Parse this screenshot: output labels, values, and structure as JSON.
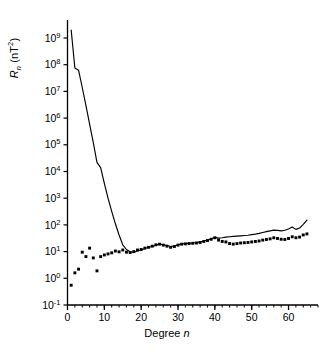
{
  "chart_data": {
    "type": "line",
    "title": "",
    "xlabel": "Degree n",
    "ylabel": "R_n (nT^2)",
    "xlabel_parts": {
      "text": "Degree ",
      "italic": "n"
    },
    "ylabel_parts": {
      "symbol": "R",
      "subscript": "n",
      "units_open": " (nT",
      "units_exp": "2",
      "units_close": ")"
    },
    "xlim": [
      0,
      68
    ],
    "ylim": [
      0.1,
      5000000000
    ],
    "yscale": "log",
    "xscale": "linear",
    "grid": false,
    "legend": null,
    "xticks": [
      0,
      10,
      20,
      30,
      40,
      50,
      60
    ],
    "xtick_labels": [
      "0",
      "10",
      "20",
      "30",
      "40",
      "50",
      "60"
    ],
    "xminor_step": 2,
    "yticks": [
      0.1,
      1,
      10,
      100,
      1000,
      10000,
      100000,
      1000000,
      10000000,
      100000000,
      1000000000
    ],
    "ytick_labels": [
      "10-1",
      "100",
      "101",
      "102",
      "103",
      "104",
      "105",
      "106",
      "107",
      "108",
      "109"
    ],
    "ytick_exponents": [
      "-1",
      "0",
      "1",
      "2",
      "3",
      "4",
      "5",
      "6",
      "7",
      "8",
      "9"
    ],
    "ytick_mantissa": "10",
    "series": [
      {
        "name": "model-spectrum-line",
        "style": "line",
        "color": "#000000",
        "x": [
          1,
          2,
          3,
          4,
          5,
          6,
          7,
          8,
          9,
          10,
          11,
          12,
          13,
          14,
          15,
          16,
          17,
          18,
          19,
          20,
          21,
          22,
          23,
          24,
          25,
          26,
          27,
          28,
          29,
          30,
          31,
          32,
          33,
          34,
          35,
          36,
          37,
          38,
          39,
          40,
          41,
          42,
          43,
          44,
          45,
          46,
          47,
          48,
          49,
          50,
          51,
          52,
          53,
          54,
          55,
          56,
          57,
          58,
          59,
          60,
          61,
          62,
          63,
          64,
          65
        ],
        "y": [
          2000000000.0,
          75000000.0,
          62000000.0,
          14000000.0,
          3000000.0,
          600000.0,
          120000.0,
          22000.0,
          14000.0,
          3600.0,
          1000.0,
          320.0,
          110.0,
          42.0,
          18.0,
          12.0,
          9.8,
          9.4,
          10.5,
          11.5,
          13.0,
          14.5,
          15.5,
          17.5,
          19.0,
          18.0,
          17.0,
          15.5,
          16.0,
          18.0,
          19.5,
          20.0,
          20.5,
          21.0,
          22.0,
          23.0,
          25.0,
          27.0,
          30.0,
          34.0,
          32.0,
          33.0,
          35.0,
          36.0,
          37.0,
          38.0,
          39.0,
          40.0,
          41.0,
          43.0,
          45.0,
          48.0,
          52.0,
          56.0,
          60.0,
          64.0,
          62.0,
          60.0,
          63.0,
          70.0,
          84.0,
          68.0,
          76.0,
          105.0,
          150.0
        ]
      },
      {
        "name": "error-estimate-dots",
        "style": "scatter",
        "color": "#000000",
        "marker": "square",
        "x": [
          1,
          2,
          3,
          4,
          5,
          6,
          7,
          8,
          9,
          10,
          11,
          12,
          13,
          14,
          15,
          16,
          17,
          18,
          19,
          20,
          21,
          22,
          23,
          24,
          25,
          26,
          27,
          28,
          29,
          30,
          31,
          32,
          33,
          34,
          35,
          36,
          37,
          38,
          39,
          40,
          41,
          42,
          43,
          44,
          45,
          46,
          47,
          48,
          49,
          50,
          51,
          52,
          53,
          54,
          55,
          56,
          57,
          58,
          59,
          60,
          61,
          62,
          63,
          64,
          65
        ],
        "y": [
          0.55,
          1.6,
          2.2,
          9.5,
          6.5,
          13.5,
          5.8,
          1.9,
          6.5,
          7.5,
          8.2,
          9.0,
          10.5,
          9.8,
          11.5,
          9.5,
          9.2,
          10.0,
          11.5,
          12.0,
          13.5,
          14.5,
          16.0,
          18.0,
          19.0,
          17.5,
          16.0,
          14.5,
          15.5,
          17.5,
          19.0,
          19.5,
          20.0,
          20.5,
          21.0,
          22.0,
          24.0,
          26.0,
          29.0,
          33.0,
          27.0,
          24.0,
          23.0,
          20.0,
          19.0,
          20.0,
          21.0,
          21.5,
          22.0,
          23.0,
          24.0,
          25.0,
          27.0,
          28.5,
          30.0,
          33.0,
          31.0,
          29.0,
          28.5,
          31.0,
          36.0,
          33.0,
          35.0,
          42.0,
          46.0
        ]
      }
    ]
  },
  "axes": {
    "frame_color": "#000000",
    "tick_color": "#000000",
    "background": "#ffffff"
  }
}
